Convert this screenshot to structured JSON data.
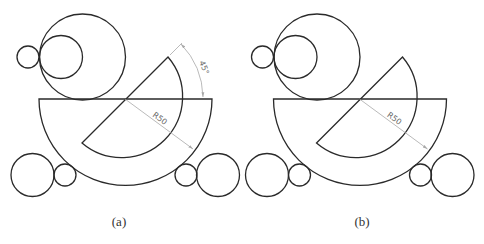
{
  "figure": {
    "panels": [
      {
        "id": "a",
        "caption": "(a)",
        "offset_x": 0,
        "dimensions": {
          "radius_label": "R50",
          "angle_label": "45°",
          "show_angle": true
        }
      },
      {
        "id": "b",
        "caption": "(b)",
        "offset_x": 234.5,
        "dimensions": {
          "radius_label": "R50",
          "show_angle": false
        }
      }
    ],
    "colors": {
      "outline": "#2a2a2a",
      "dimension": "#a8a8a8",
      "background": "#ffffff"
    }
  }
}
